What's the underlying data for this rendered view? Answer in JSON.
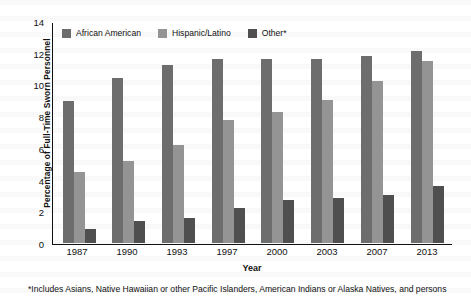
{
  "chart_data": {
    "type": "bar",
    "title": "",
    "xlabel": "Year",
    "ylabel": "Percentage of Full-Time Sworn Personnel",
    "categories": [
      "1987",
      "1990",
      "1993",
      "1997",
      "2000",
      "2003",
      "2007",
      "2013"
    ],
    "ylim": [
      0,
      14
    ],
    "yticks": [
      "0",
      "2",
      "4",
      "6",
      "8",
      "10",
      "12",
      "14"
    ],
    "grid": false,
    "legend_position": "top-left-inside",
    "series": [
      {
        "name": "African American",
        "color": "#6d6d6d",
        "values": [
          9.0,
          10.5,
          11.3,
          11.7,
          11.7,
          11.7,
          11.9,
          12.2
        ]
      },
      {
        "name": "Hispanic/Latino",
        "color": "#949494",
        "values": [
          4.5,
          5.2,
          6.2,
          7.8,
          8.3,
          9.1,
          10.3,
          11.55
        ]
      },
      {
        "name": "Other*",
        "color": "#4f4f4f",
        "values": [
          0.85,
          1.35,
          1.6,
          2.2,
          2.7,
          2.85,
          3.05,
          3.6
        ]
      }
    ],
    "footnote": "*Includes Asians, Native Hawaiian or other Pacific Islanders, American Indians or Alaska Natives, and persons"
  }
}
